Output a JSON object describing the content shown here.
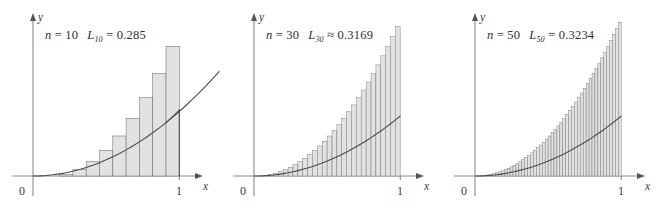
{
  "figure": {
    "background_color": "#ffffff",
    "width": 662,
    "height": 210,
    "panel_count": 3
  },
  "chart_data": {
    "type": "area",
    "xlabel": "x",
    "ylabel": "y",
    "xlim": [
      0,
      1
    ],
    "ylim": [
      0,
      1
    ],
    "grid": false,
    "legend": false,
    "curve_function": "y = x^2",
    "rectangle_rule": "left-endpoint (lower sum)",
    "panels": [
      {
        "id": "panel-1",
        "n": 10,
        "n_label": "10",
        "sum_symbol": "L",
        "sum_subscript": "10",
        "relation": "=",
        "sum_value": "0.285",
        "annotation": "n = 10   L10 = 0.285",
        "x_tick_labels": [
          "0",
          "1"
        ],
        "y_axis_label": "y",
        "x_axis_label": "x",
        "rect_left_edges": [
          0,
          0.1,
          0.2,
          0.3,
          0.4,
          0.5,
          0.6,
          0.7,
          0.8,
          0.9
        ],
        "rect_heights": [
          0,
          0.01,
          0.04,
          0.09,
          0.16,
          0.25,
          0.36,
          0.49,
          0.64,
          0.81
        ]
      },
      {
        "id": "panel-2",
        "n": 30,
        "n_label": "30",
        "sum_symbol": "L",
        "sum_subscript": "30",
        "relation": "≈",
        "sum_value": "0.3169",
        "annotation": "n = 30   L30 ≈ 0.3169",
        "x_tick_labels": [
          "0",
          "1"
        ],
        "y_axis_label": "y",
        "x_axis_label": "x"
      },
      {
        "id": "panel-3",
        "n": 50,
        "n_label": "50",
        "sum_symbol": "L",
        "sum_subscript": "50",
        "relation": "=",
        "sum_value": "0.3234",
        "annotation": "n = 50   L50 = 0.3234",
        "x_tick_labels": [
          "0",
          "1"
        ],
        "y_axis_label": "y",
        "x_axis_label": "x"
      }
    ],
    "colors": {
      "rect_fill": "#e2e2e2",
      "rect_stroke": "#6e6e6e",
      "curve_stroke": "#4a4a4a",
      "axis_stroke": "#8a8a8a",
      "text": "#2e2e2e"
    }
  }
}
